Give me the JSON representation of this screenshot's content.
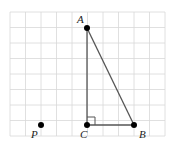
{
  "diagram": {
    "grid": {
      "x0": 10,
      "y0": 12,
      "cols": 10,
      "rows": 8,
      "step": 15.5,
      "line_color": "#d8d8d8"
    },
    "colors": {
      "line": "#555555",
      "point": "#000000"
    },
    "points": [
      {
        "name": "A",
        "x": 87,
        "y": 28,
        "label": "A",
        "lx": 77,
        "ly": 23
      },
      {
        "name": "C",
        "x": 87,
        "y": 125,
        "label": "C",
        "lx": 80,
        "ly": 138
      },
      {
        "name": "B",
        "x": 134,
        "y": 125,
        "label": "B",
        "lx": 139,
        "ly": 138
      },
      {
        "name": "P",
        "x": 41,
        "y": 125,
        "label": "P",
        "lx": 31,
        "ly": 138
      }
    ],
    "segments": [
      [
        "A",
        "C"
      ],
      [
        "C",
        "B"
      ],
      [
        "A",
        "B"
      ]
    ],
    "right_angle": {
      "at": "C",
      "size": 8
    }
  }
}
